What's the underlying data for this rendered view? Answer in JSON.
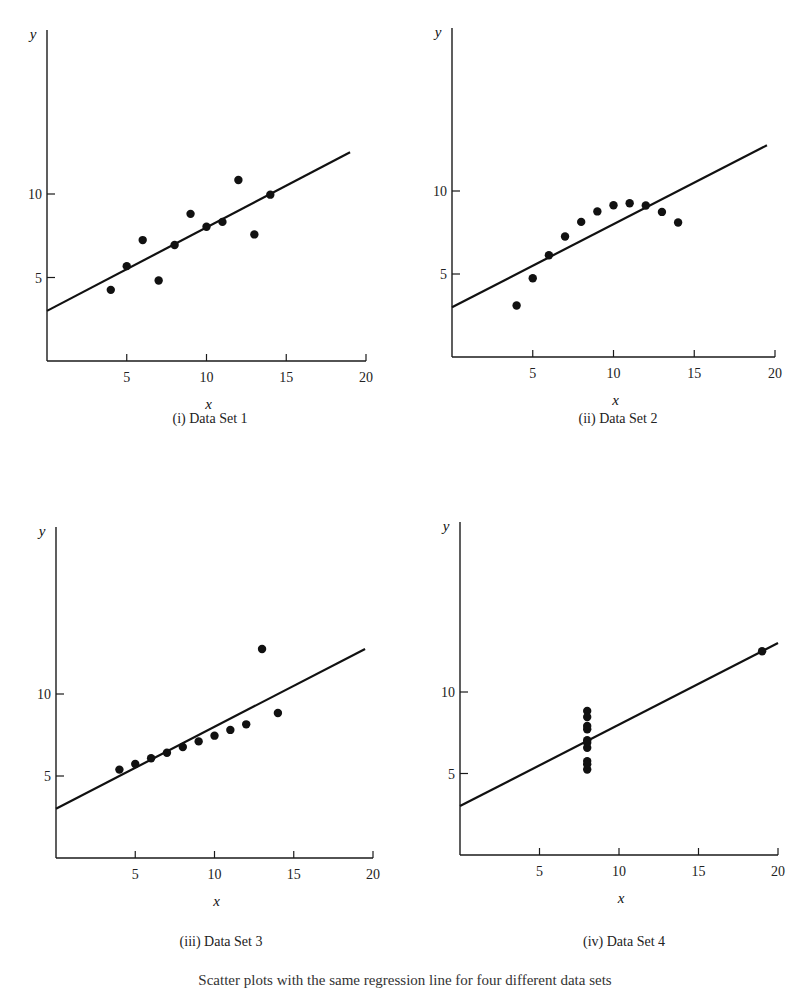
{
  "figure": {
    "caption_partial": "Scatter plots with the same regression line for four different data sets"
  },
  "panels": [
    {
      "caption": "(i) Data Set 1",
      "xlabel": "x",
      "ylabel": "y"
    },
    {
      "caption": "(ii) Data Set 2",
      "xlabel": "x",
      "ylabel": "y"
    },
    {
      "caption": "(iii) Data Set 3",
      "xlabel": "x",
      "ylabel": "y"
    },
    {
      "caption": "(iv) Data Set 4",
      "xlabel": "x",
      "ylabel": "y"
    }
  ],
  "axis": {
    "x_ticks": [
      "5",
      "10",
      "15",
      "20"
    ],
    "y_ticks": [
      "5",
      "10"
    ]
  },
  "chart_data": [
    {
      "type": "scatter",
      "title": "(i) Data Set 1",
      "xlabel": "x",
      "ylabel": "y",
      "xlim": [
        0,
        20
      ],
      "ylim": [
        0,
        19
      ],
      "x_ticks": [
        5,
        10,
        15,
        20
      ],
      "y_ticks": [
        5,
        10
      ],
      "grid": false,
      "x": [
        10,
        8,
        13,
        9,
        11,
        14,
        6,
        4,
        12,
        7,
        5
      ],
      "y": [
        8.04,
        6.95,
        7.58,
        8.81,
        8.33,
        9.96,
        7.24,
        4.26,
        10.84,
        4.82,
        5.68
      ],
      "regression_line": {
        "intercept": 3.0,
        "slope": 0.5,
        "x_range": [
          0,
          19
        ]
      }
    },
    {
      "type": "scatter",
      "title": "(ii) Data Set 2",
      "xlabel": "x",
      "ylabel": "y",
      "xlim": [
        0,
        20
      ],
      "ylim": [
        0,
        19
      ],
      "x_ticks": [
        5,
        10,
        15,
        20
      ],
      "y_ticks": [
        5,
        10
      ],
      "grid": false,
      "x": [
        10,
        8,
        13,
        9,
        11,
        14,
        6,
        4,
        12,
        7,
        5
      ],
      "y": [
        9.14,
        8.14,
        8.74,
        8.77,
        9.26,
        8.1,
        6.13,
        3.1,
        9.13,
        7.26,
        4.74
      ],
      "regression_line": {
        "intercept": 3.0,
        "slope": 0.5,
        "x_range": [
          0,
          19.5
        ]
      }
    },
    {
      "type": "scatter",
      "title": "(iii) Data Set 3",
      "xlabel": "x",
      "ylabel": "y",
      "xlim": [
        0,
        20
      ],
      "ylim": [
        0,
        19
      ],
      "x_ticks": [
        5,
        10,
        15,
        20
      ],
      "y_ticks": [
        5,
        10
      ],
      "grid": false,
      "x": [
        10,
        8,
        13,
        9,
        11,
        14,
        6,
        4,
        12,
        7,
        5
      ],
      "y": [
        7.46,
        6.77,
        12.74,
        7.11,
        7.81,
        8.84,
        6.08,
        5.39,
        8.15,
        6.42,
        5.73
      ],
      "regression_line": {
        "intercept": 3.0,
        "slope": 0.5,
        "x_range": [
          0,
          19.5
        ]
      }
    },
    {
      "type": "scatter",
      "title": "(iv) Data Set 4",
      "xlabel": "x",
      "ylabel": "y",
      "xlim": [
        0,
        20
      ],
      "ylim": [
        0,
        19
      ],
      "x_ticks": [
        5,
        10,
        15,
        20
      ],
      "y_ticks": [
        5,
        10
      ],
      "grid": false,
      "x": [
        8,
        8,
        8,
        8,
        8,
        8,
        8,
        19,
        8,
        8,
        8
      ],
      "y": [
        6.58,
        5.76,
        7.71,
        8.84,
        8.47,
        7.04,
        5.25,
        12.5,
        5.56,
        7.91,
        6.89
      ],
      "regression_line": {
        "intercept": 3.0,
        "slope": 0.5,
        "x_range": [
          0,
          20
        ]
      }
    }
  ]
}
